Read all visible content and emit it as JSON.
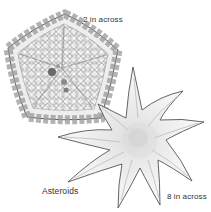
{
  "figure": {
    "title": "Asteroids",
    "specimens": [
      {
        "id": "pentagonal",
        "shape": "pentagon with plated surface",
        "size_label": "2 in across"
      },
      {
        "id": "nine-armed",
        "shape": "nine-armed star",
        "size_label": "8 in across"
      }
    ],
    "colors": {
      "ink": "#333333",
      "shade": "#bdbdbd",
      "fill": "#f6f6f6",
      "background": "#ffffff"
    }
  }
}
